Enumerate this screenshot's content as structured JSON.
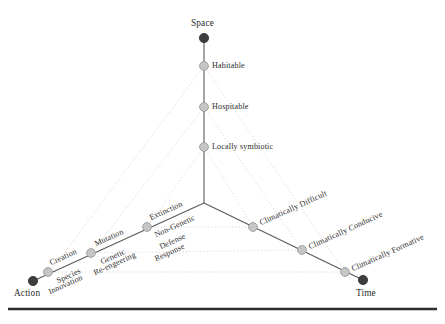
{
  "figure": {
    "background_color": "#ffffff",
    "node_color": "#c6c6c6",
    "endpoint_color": "#3d3d3d",
    "axis_color": "#5a5a5a",
    "dotted_color": "#c9c9c9",
    "rule_color": "#2c2c2c"
  },
  "axes": {
    "space": {
      "endpoint_label": "Space",
      "nodes": [
        {
          "label": "Habitable"
        },
        {
          "label": "Hospitable"
        },
        {
          "label": "Locally symbiotic"
        }
      ]
    },
    "action": {
      "endpoint_label": "Action",
      "nodes": [
        {
          "label_above": "Creation",
          "label_below": "Species Innovation"
        },
        {
          "label_above": "Mutation",
          "label_below": "Genetic Re-engeering"
        },
        {
          "label_above": "Extinction",
          "label_below": "Non-Genetic Defense Response"
        }
      ]
    },
    "time": {
      "endpoint_label": "Time",
      "nodes": [
        {
          "label": "Climatically Difficult"
        },
        {
          "label": "Climatically Conducive"
        },
        {
          "label": "Climatically Formative"
        }
      ]
    }
  },
  "labels": {
    "space_endpoint": "Space",
    "space_n1": "Habitable",
    "space_n2": "Hospitable",
    "space_n3": "Locally symbiotic",
    "action_endpoint": "Action",
    "action_n1_above": "Creation",
    "action_n1_below_a": "Species",
    "action_n1_below_b": "Innovation",
    "action_n2_above": "Mutation",
    "action_n2_below_a": "Genetic",
    "action_n2_below_b": "Re-engeering",
    "action_n3_above": "Extinction",
    "action_n3_below_a": "Non-Genetic",
    "action_n3_below_b": "Defense",
    "action_n3_below_c": "Response",
    "time_endpoint": "Time",
    "time_n1": "Climatically Difficult",
    "time_n2": "Climatically Conducive",
    "time_n3": "Climatically Formative"
  }
}
